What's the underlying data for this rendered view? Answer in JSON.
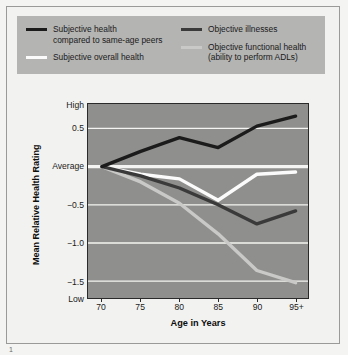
{
  "figure": {
    "background_color": "#f2f2f0",
    "plot_background_color": "#8f8f8d",
    "legend_background_color": "#b4b4b2"
  },
  "legend": {
    "columns": [
      {
        "entries": [
          {
            "swatch": "black-line-swatch",
            "color": "#1b1b1b",
            "line1": "Subjective health",
            "line2": "compared to same-age peers"
          },
          {
            "swatch": "white-line-swatch",
            "color": "#fbfbfb",
            "line1": "Subjective overall health",
            "line2": ""
          }
        ]
      },
      {
        "entries": [
          {
            "swatch": "dark-gray-line-swatch",
            "color": "#3a3a3a",
            "line1": "Objective illnesses",
            "line2": ""
          },
          {
            "swatch": "light-gray-line-swatch",
            "color": "#c9c9c7",
            "line1": "Objective functional health",
            "line2": "(ability to perform ADLs)"
          }
        ]
      }
    ]
  },
  "chart_data": {
    "type": "line",
    "title": "",
    "xlabel": "Age in Years",
    "ylabel": "Mean Relative Health Rating",
    "x": [
      70,
      75,
      80,
      85,
      90,
      95
    ],
    "categories": [
      "70",
      "75",
      "80",
      "85",
      "90",
      "95+"
    ],
    "ylim": [
      -1.72,
      0.82
    ],
    "xlim": [
      68.2,
      96.6
    ],
    "grid": true,
    "gridlines": [
      0.5,
      0.0,
      -0.5,
      -1.0,
      -1.5
    ],
    "y_tick_labels": [
      {
        "value": 0.8,
        "label": "High"
      },
      {
        "value": 0.5,
        "label": "0.5"
      },
      {
        "value": 0.0,
        "label": "Average"
      },
      {
        "value": -0.5,
        "label": "−0.5"
      },
      {
        "value": -1.0,
        "label": "−1.0"
      },
      {
        "value": -1.5,
        "label": "−1.5"
      },
      {
        "value": -1.72,
        "label": "Low"
      }
    ],
    "legend_position": "top",
    "series": [
      {
        "name": "Subjective health compared to same-age peers",
        "color": "#1b1b1b",
        "width": 3.4,
        "values": [
          0.0,
          0.2,
          0.38,
          0.25,
          0.53,
          0.66
        ]
      },
      {
        "name": "Subjective overall health",
        "color": "#fbfbfb",
        "width": 3.4,
        "values": [
          0.0,
          -0.1,
          -0.16,
          -0.44,
          -0.1,
          -0.07
        ]
      },
      {
        "name": "Objective illnesses",
        "color": "#3a3a3a",
        "width": 3.4,
        "values": [
          0.0,
          -0.12,
          -0.28,
          -0.5,
          -0.75,
          -0.58
        ]
      },
      {
        "name": "Objective functional health (ability to perform ADLs)",
        "color": "#c9c9c7",
        "width": 3.4,
        "values": [
          0.0,
          -0.2,
          -0.48,
          -0.88,
          -1.36,
          -1.52
        ]
      }
    ]
  },
  "corner_mark": "1"
}
